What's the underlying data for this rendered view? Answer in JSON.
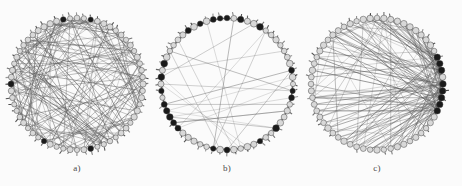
{
  "figure": {
    "width": 462,
    "height": 186,
    "background_color": "#fbfbfb",
    "edge_color": "#5a5a5a",
    "node_fill_color": "#d8d8d8",
    "node_stroke_color": "#3a3a3a",
    "hub_color": "#1a1a1a"
  },
  "panels": [
    {
      "caption": "a)",
      "center_x": 78,
      "center_y": 84,
      "radius": 68,
      "node_count": 60,
      "topology": "random",
      "description": "dense random chords across interior"
    },
    {
      "caption": "b)",
      "center_x": 228,
      "center_y": 84,
      "radius": 68,
      "node_count": 60,
      "topology": "ring-lattice",
      "description": "perimeter ring edges with few long chords"
    },
    {
      "caption": "c)",
      "center_x": 378,
      "center_y": 84,
      "radius": 68,
      "node_count": 60,
      "topology": "scale-free",
      "description": "edges converging on right-side hub cluster"
    }
  ],
  "chart_data": {
    "type": "scatter",
    "title": "",
    "xlabel": "",
    "ylabel": "",
    "layout": "circular ring layout, three panels side by side",
    "legend": "none",
    "grid": false,
    "panels": [
      {
        "label": "a)",
        "graph_type": "random-graph",
        "nodes": 60,
        "approx_edges": 180,
        "mean_degree": 6,
        "edge_pattern": "uniformly random chords spanning the full disc"
      },
      {
        "label": "b)",
        "graph_type": "small-world-ring",
        "nodes": 60,
        "approx_edges": 150,
        "mean_degree": 5,
        "edge_pattern": "short-range neighbour links along perimeter plus about 20 long rewired chords"
      },
      {
        "label": "c)",
        "graph_type": "scale-free",
        "nodes": 60,
        "approx_edges": 170,
        "mean_degree": 5.7,
        "edge_pattern": "preferential attachment, dense hub cluster at right edge of ring"
      }
    ]
  }
}
